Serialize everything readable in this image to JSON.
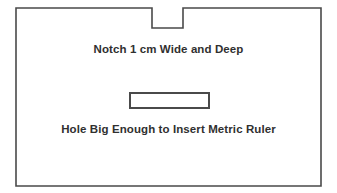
{
  "figure": {
    "background_color": "#ffffff",
    "outline_color": "#4a4a4a",
    "text_color": "#303030"
  },
  "labels": {
    "notch": "Notch 1 cm Wide and Deep",
    "hole": "Hole Big Enough to Insert Metric Ruler"
  },
  "shapes": {
    "card": {
      "name": "card-outline",
      "x": 16,
      "y": 8,
      "width": 305,
      "height": 178,
      "stroke": "#4a4a4a",
      "stroke_width": 1.6,
      "fill": "#ffffff"
    },
    "notch": {
      "name": "top-notch",
      "x": 152,
      "y": 8,
      "width": 31,
      "depth": 20,
      "description": "Notch 1 cm Wide and Deep"
    },
    "hole": {
      "name": "ruler-slot",
      "x": 130,
      "y": 93,
      "width": 79,
      "height": 15,
      "stroke": "#4a4a4a",
      "stroke_width": 2,
      "fill": "#ffffff",
      "description": "Hole Big Enough to Insert Metric Ruler"
    }
  }
}
